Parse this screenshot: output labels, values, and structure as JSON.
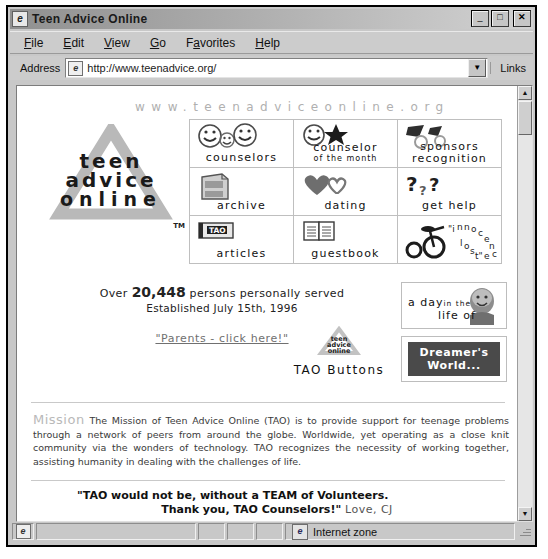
{
  "window": {
    "title": "Teen Advice Online",
    "icon": "ie-document-icon",
    "buttons": {
      "minimize": "_",
      "maximize": "□",
      "close": "✕"
    }
  },
  "menu": {
    "items": [
      {
        "label": "File",
        "accel": "F"
      },
      {
        "label": "Edit",
        "accel": "E"
      },
      {
        "label": "View",
        "accel": "V"
      },
      {
        "label": "Go",
        "accel": "G"
      },
      {
        "label": "Favorites",
        "accel": "a"
      },
      {
        "label": "Help",
        "accel": "H"
      }
    ]
  },
  "address_bar": {
    "label": "Address",
    "url": "http://www.teenadvice.org/",
    "dropdown_icon": "▼",
    "links_label": "Links"
  },
  "page": {
    "site_url_header": "www.teenadviceonline.org",
    "logo": {
      "line1": "teen",
      "line2": "advice",
      "line3": "online",
      "trademark": "TM"
    },
    "nav_grid": [
      {
        "label": "counselors",
        "sublabel": "",
        "icon": "smiley-faces-icon"
      },
      {
        "label": "counselor",
        "sublabel": "of the month",
        "icon": "smiley-star-icon"
      },
      {
        "label": "sponsors",
        "sublabel": "recognition",
        "icon": "megaphone-icon"
      },
      {
        "label": "archive",
        "sublabel": "",
        "icon": "file-cabinet-icon"
      },
      {
        "label": "dating",
        "sublabel": "",
        "icon": "hearts-icon"
      },
      {
        "label": "get help",
        "sublabel": "",
        "icon": "question-marks-icon"
      },
      {
        "label": "articles",
        "sublabel": "",
        "icon": "tao-book-icon"
      },
      {
        "label": "guestbook",
        "sublabel": "",
        "icon": "open-book-icon"
      },
      {
        "label": "\"innocence lost\"",
        "sublabel": "",
        "icon": "tricycle-icon"
      }
    ],
    "counter": {
      "prefix": "Over",
      "count": "20,448",
      "suffix": "persons personally served",
      "established": "Established July 15th, 1996"
    },
    "parents_link": "\"Parents - click here!\"",
    "tao_buttons_label": "TAO Buttons",
    "panel_a_day": {
      "line1": "a day",
      "line2_small": "in the",
      "line3": "life of",
      "icon": "baby-photo-icon"
    },
    "panel_dreamer": {
      "line1": "Dreamer's",
      "line2": "World..."
    },
    "mission": {
      "heading": "Mission",
      "body": "The Mission of Teen Advice Online (TAO) is to provide support for teenage problems through a network of peers from around the globe. Worldwide, yet operating as a close knit community via the wonders of technology. TAO recognizes the necessity of working together, assisting humanity in dealing with the challenges of life."
    },
    "quote": {
      "line1": "\"TAO would not be, without a TEAM of Volunteers.",
      "line2": "Thank you, TAO Counselors!\"",
      "signature": "Love, CJ"
    }
  },
  "status_bar": {
    "zone_label": "Internet zone",
    "zone_icon": "ie-globe-icon"
  },
  "scrollbar": {
    "up": "▲",
    "down": "▼"
  }
}
